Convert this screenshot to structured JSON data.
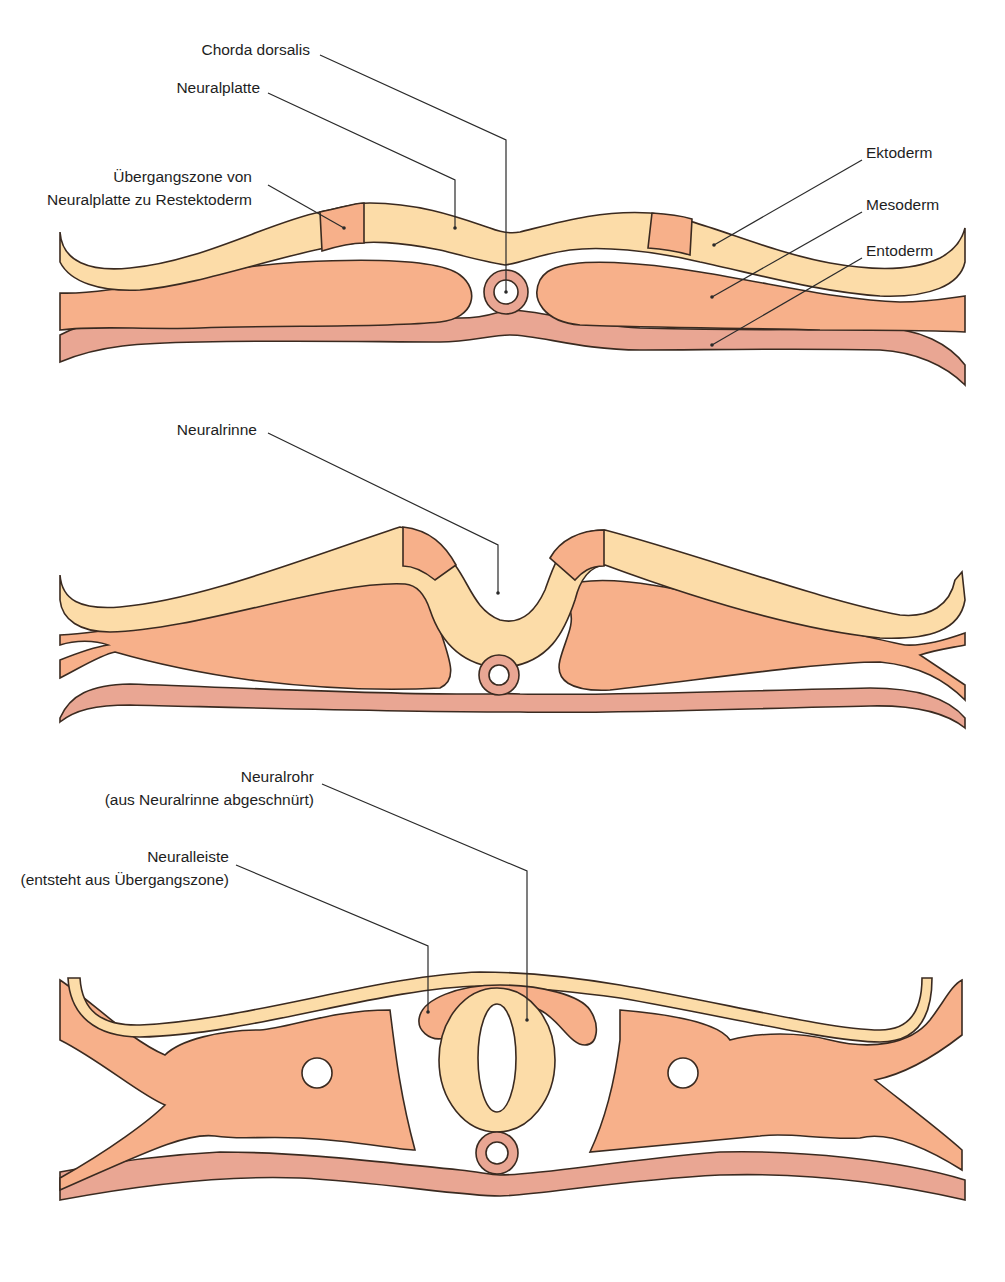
{
  "colors": {
    "ectoderm": "#FCDCA8",
    "mesoderm": "#F7B08A",
    "transition_zone": "#F7B08A",
    "entoderm": "#E9A693",
    "outline": "#3a2a20",
    "background": "#ffffff"
  },
  "panels": [
    {
      "name": "neural-plate-stage",
      "labels": {
        "chorda": "Chorda dorsalis",
        "neuralplatte": "Neuralplatte",
        "uebergang_line1": "Übergangszone von",
        "uebergang_line2": "Neuralplatte zu Restektoderm",
        "ektoderm": "Ektoderm",
        "mesoderm": "Mesoderm",
        "entoderm": "Entoderm"
      }
    },
    {
      "name": "neural-groove-stage",
      "labels": {
        "neuralrinne": "Neuralrinne"
      }
    },
    {
      "name": "neural-tube-stage",
      "labels": {
        "neuralrohr_line1": "Neuralrohr",
        "neuralrohr_line2": "(aus Neuralrinne abgeschnürt)",
        "neuralleiste_line1": "Neuralleiste",
        "neuralleiste_line2": "(entsteht aus Übergangszone)"
      }
    }
  ]
}
